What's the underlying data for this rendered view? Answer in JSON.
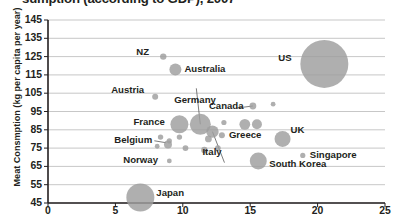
{
  "chart_data": {
    "type": "scatter",
    "title_visible_fragment": "sumption (according to GDP), 2007",
    "xlabel": "",
    "ylabel": "Meat Consmption (kg per capita per year)",
    "xlim": [
      0,
      25
    ],
    "ylim": [
      45,
      145
    ],
    "x_ticks": [
      "0",
      "5",
      "10",
      "15",
      "20",
      "25"
    ],
    "y_ticks": [
      "45",
      "55",
      "65",
      "75",
      "85",
      "95",
      "105",
      "115",
      "125",
      "135",
      "145"
    ],
    "grid": "horizontal",
    "legend": "none",
    "bubble_color": "#9d9d9d",
    "axis_color": "#231f20",
    "gridline_color": "#b9b9b9",
    "points": [
      {
        "label": "US",
        "x": 20.5,
        "y": 121,
        "size": 24.0,
        "label_dx": -46,
        "label_dy": -6
      },
      {
        "label": "NZ",
        "x": 8.55,
        "y": 125,
        "size": 3.2,
        "label_dx": -27,
        "label_dy": -5
      },
      {
        "label": "Australia",
        "x": 9.45,
        "y": 118,
        "size": 6.0,
        "label_dx": 9,
        "label_dy": 0
      },
      {
        "label": "Austria",
        "x": 7.95,
        "y": 103,
        "size": 3.0,
        "label_dx": -44,
        "label_dy": -7
      },
      {
        "label": "Canada",
        "x": 15.2,
        "y": 98,
        "size": 3.4,
        "label_dx": -44,
        "label_dy": 0
      },
      {
        "label": "Germany",
        "x": 11.3,
        "y": 88,
        "size": 10.5,
        "label_dx": -26,
        "label_dy": -24
      },
      {
        "label": "France",
        "x": 9.75,
        "y": 88,
        "size": 9.0,
        "label_dx": -46,
        "label_dy": -2
      },
      {
        "label": "Italy",
        "x": 12.2,
        "y": 84,
        "size": 6.2,
        "label_dx": -10,
        "label_dy": 20
      },
      {
        "label": "Greece",
        "x": 12.9,
        "y": 82,
        "size": 3.0,
        "label_dx": 7,
        "label_dy": 0
      },
      {
        "label": "UK",
        "x": 17.4,
        "y": 80,
        "size": 8.0,
        "label_dx": 8,
        "label_dy": -9
      },
      {
        "label": "Belgium",
        "x": 9.0,
        "y": 79,
        "size": 2.6,
        "label_dx": -55,
        "label_dy": -1
      },
      {
        "label": "Singapore",
        "x": 18.9,
        "y": 71,
        "size": 2.6,
        "label_dx": 7,
        "label_dy": 0
      },
      {
        "label": "South Korea",
        "x": 15.6,
        "y": 68,
        "size": 8.5,
        "label_dx": 11,
        "label_dy": 3
      },
      {
        "label": "Norway",
        "x": 9.0,
        "y": 68,
        "size": 2.4,
        "label_dx": -46,
        "label_dy": -1
      },
      {
        "label": "Japan",
        "x": 6.85,
        "y": 48,
        "size": 14.0,
        "label_dx": 16,
        "label_dy": -5
      }
    ],
    "unlabeled_points": [
      {
        "x": 8.35,
        "y": 81,
        "size": 2.7
      },
      {
        "x": 9.75,
        "y": 81,
        "size": 2.7
      },
      {
        "x": 8.1,
        "y": 76,
        "size": 2.4
      },
      {
        "x": 8.9,
        "y": 77,
        "size": 4.0
      },
      {
        "x": 10.2,
        "y": 75,
        "size": 2.9
      },
      {
        "x": 11.6,
        "y": 74,
        "size": 3.2
      },
      {
        "x": 12.6,
        "y": 75,
        "size": 2.9
      },
      {
        "x": 11.9,
        "y": 80,
        "size": 3.4
      },
      {
        "x": 14.6,
        "y": 88,
        "size": 5.4
      },
      {
        "x": 15.5,
        "y": 88,
        "size": 5.0
      },
      {
        "x": 13.05,
        "y": 89,
        "size": 2.6
      },
      {
        "x": 16.7,
        "y": 99,
        "size": 2.4
      }
    ]
  }
}
